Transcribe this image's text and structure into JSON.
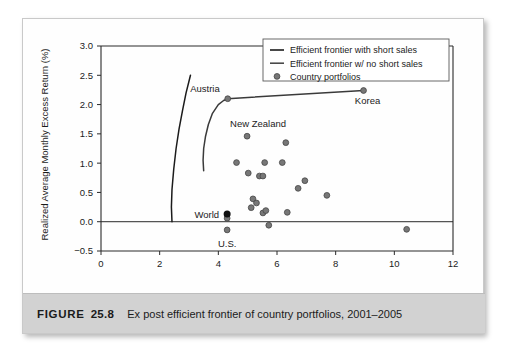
{
  "figure": {
    "label": "FIGURE",
    "number": "25.8",
    "caption": "Ex post efficient frontier of country portfolios, 2001–2005"
  },
  "chart_data": {
    "type": "scatter",
    "title": "",
    "xlabel": "Standard Deviation (% per month)",
    "ylabel": "Realized Average Monthly Excess Return (%)",
    "xlim": [
      0,
      12
    ],
    "ylim": [
      -0.5,
      3.0
    ],
    "xticks": [
      "0",
      "2",
      "4",
      "6",
      "8",
      "10",
      "12"
    ],
    "yticks": [
      "-0.5",
      "0.0",
      "0.5",
      "1.0",
      "1.5",
      "2.0",
      "2.5",
      "3.0"
    ],
    "grid": false,
    "zero_line": true,
    "legend_position": "top-right",
    "legend": [
      {
        "label": "Efficient frontier with short sales",
        "marker": "line",
        "color": "#1b1b1b"
      },
      {
        "label": "Efficient frontier w/ no short sales",
        "marker": "line",
        "color": "#4a4a4a"
      },
      {
        "label": "Country portfolios",
        "marker": "circle",
        "color": "#777777"
      }
    ],
    "series": [
      {
        "name": "Country portfolios",
        "type": "scatter",
        "color": "#777777",
        "points": [
          {
            "x": 4.3,
            "y": -0.14,
            "label": "U.S."
          },
          {
            "x": 4.3,
            "y": 0.06,
            "label": ""
          },
          {
            "x": 4.32,
            "y": 2.1,
            "label": "Austria"
          },
          {
            "x": 4.62,
            "y": 1.01,
            "label": ""
          },
          {
            "x": 4.98,
            "y": 1.46,
            "label": "New Zealand"
          },
          {
            "x": 5.02,
            "y": 0.83,
            "label": ""
          },
          {
            "x": 5.12,
            "y": 0.24,
            "label": ""
          },
          {
            "x": 5.18,
            "y": 0.39,
            "label": ""
          },
          {
            "x": 5.3,
            "y": 0.32,
            "label": ""
          },
          {
            "x": 5.4,
            "y": 0.78,
            "label": ""
          },
          {
            "x": 5.52,
            "y": 0.78,
            "label": ""
          },
          {
            "x": 5.52,
            "y": 0.15,
            "label": ""
          },
          {
            "x": 5.62,
            "y": 0.19,
            "label": ""
          },
          {
            "x": 5.58,
            "y": 1.01,
            "label": ""
          },
          {
            "x": 5.72,
            "y": -0.06,
            "label": ""
          },
          {
            "x": 6.18,
            "y": 1.01,
            "label": ""
          },
          {
            "x": 6.3,
            "y": 1.35,
            "label": ""
          },
          {
            "x": 6.35,
            "y": 0.16,
            "label": ""
          },
          {
            "x": 6.72,
            "y": 0.57,
            "label": ""
          },
          {
            "x": 6.95,
            "y": 0.7,
            "label": ""
          },
          {
            "x": 7.7,
            "y": 0.45,
            "label": ""
          },
          {
            "x": 8.95,
            "y": 2.24,
            "label": "Korea"
          },
          {
            "x": 10.42,
            "y": -0.13,
            "label": ""
          }
        ]
      },
      {
        "name": "World",
        "type": "scatter",
        "color": "#101010",
        "points": [
          {
            "x": 4.3,
            "y": 0.13,
            "label": "World"
          }
        ]
      },
      {
        "name": "Efficient frontier with short sales",
        "type": "line",
        "color": "#1b1b1b",
        "points": [
          {
            "x": 2.42,
            "y": 0.0
          },
          {
            "x": 2.4,
            "y": 0.25
          },
          {
            "x": 2.42,
            "y": 0.55
          },
          {
            "x": 2.48,
            "y": 0.9
          },
          {
            "x": 2.56,
            "y": 1.25
          },
          {
            "x": 2.66,
            "y": 1.58
          },
          {
            "x": 2.78,
            "y": 1.9
          },
          {
            "x": 2.9,
            "y": 2.2
          },
          {
            "x": 3.05,
            "y": 2.5
          }
        ]
      },
      {
        "name": "Efficient frontier w/ no short sales",
        "type": "line",
        "color": "#3a3a3a",
        "points": [
          {
            "x": 3.5,
            "y": 0.87
          },
          {
            "x": 3.48,
            "y": 1.05
          },
          {
            "x": 3.5,
            "y": 1.25
          },
          {
            "x": 3.56,
            "y": 1.45
          },
          {
            "x": 3.66,
            "y": 1.66
          },
          {
            "x": 3.8,
            "y": 1.85
          },
          {
            "x": 4.0,
            "y": 2.0
          },
          {
            "x": 4.18,
            "y": 2.07
          },
          {
            "x": 4.32,
            "y": 2.1
          },
          {
            "x": 8.95,
            "y": 2.24
          }
        ]
      }
    ],
    "annotations": [
      {
        "text": "Austria",
        "x": 4.32,
        "y": 2.1
      },
      {
        "text": "Korea",
        "x": 8.95,
        "y": 2.24
      },
      {
        "text": "New Zealand",
        "x": 4.4,
        "y": 1.62
      },
      {
        "text": "World",
        "x": 4.3,
        "y": 0.13
      },
      {
        "text": "U.S.",
        "x": 4.3,
        "y": -0.14
      }
    ]
  }
}
